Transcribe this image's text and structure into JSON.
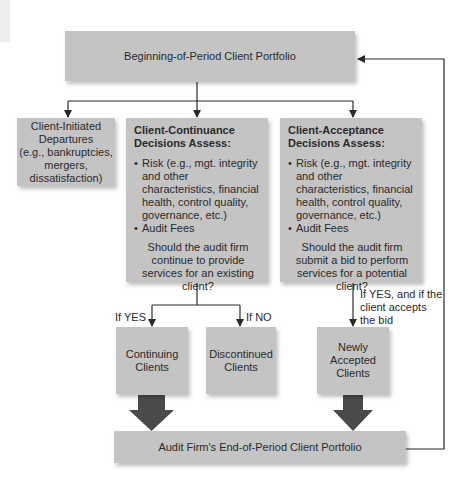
{
  "diagram": {
    "top_box": "Beginning-of-Period Client Portfolio",
    "departures_box": {
      "lines": [
        "Client-Initiated",
        "Departures",
        "(e.g., bankruptcies,",
        "mergers,",
        "dissatisfaction)"
      ]
    },
    "continuance_box": {
      "heading_line1": "Client-Continuance",
      "heading_line2": "Decisions Assess:",
      "bullets": [
        "Risk (e.g., mgt. integrity and other characteristics, financial health, control quality, governance, etc.)",
        "Audit Fees"
      ],
      "question": "Should the audit firm continue to provide services for an existing client?"
    },
    "acceptance_box": {
      "heading_line1": "Client-Acceptance",
      "heading_line2": "Decisions Assess:",
      "bullets": [
        "Risk (e.g., mgt. integrity and other characteristics, financial health, control quality, governance, etc.)",
        "Audit Fees"
      ],
      "question": "Should the audit firm submit a bid to perform services for a potential client?"
    },
    "labels": {
      "if_yes": "If YES",
      "if_no": "If NO",
      "if_yes_accepts": "If YES, and if the client accepts the bid"
    },
    "continuing_box": "Continuing Clients",
    "discontinued_box": "Discontinued Clients",
    "newly_accepted_box": "Newly Accepted Clients",
    "bottom_box": "Audit Firm's End-of-Period Client Portfolio",
    "colors": {
      "box_fill": "#c4c4c4",
      "line": "#2a2a2a",
      "fat_arrow": "#4a4a4a"
    }
  }
}
